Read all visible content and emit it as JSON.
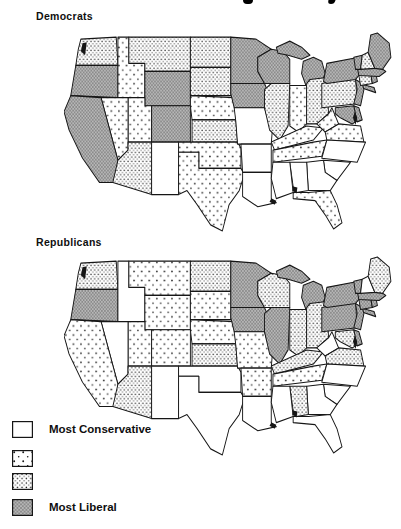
{
  "figure": {
    "maps": [
      {
        "id": "democrats",
        "label": "Democrats",
        "states": {
          "WA": 3,
          "OR": 4,
          "CA": 4,
          "ID": 2,
          "NV": 2,
          "UT": 2,
          "AZ": 3,
          "MT": 3,
          "WY": 4,
          "CO": 4,
          "NM": 1,
          "ND": 3,
          "SD": 3,
          "NE": 2,
          "KS": 3,
          "OK": 2,
          "TX": 2,
          "MN": 4,
          "IA": 4,
          "MO": 1,
          "AR": 1,
          "LA": 1,
          "WI": 4,
          "IL": 3,
          "MI": 4,
          "IN": 2,
          "OH": 3,
          "KY": 2,
          "TN": 2,
          "MS": 1,
          "AL": 1,
          "GA": 1,
          "FL": 2,
          "SC": 1,
          "NC": 1,
          "VA": 2,
          "WV": 2,
          "PA": 3,
          "NY": 4,
          "NJ": 4,
          "CT": 3,
          "RI": 4,
          "MA": 4,
          "VT": 4,
          "NH": 3,
          "ME": 4,
          "MD": 4,
          "DE": 4
        }
      },
      {
        "id": "republicans",
        "label": "Republicans",
        "states": {
          "WA": 3,
          "OR": 4,
          "CA": 2,
          "ID": 1,
          "NV": 1,
          "UT": 2,
          "AZ": 3,
          "MT": 2,
          "WY": 2,
          "CO": 2,
          "NM": 1,
          "ND": 3,
          "SD": 2,
          "NE": 2,
          "KS": 3,
          "OK": 1,
          "TX": 1,
          "MN": 4,
          "IA": 4,
          "MO": 2,
          "AR": 2,
          "LA": 1,
          "WI": 3,
          "IL": 4,
          "MI": 4,
          "IN": 3,
          "OH": 3,
          "KY": 3,
          "TN": 2,
          "MS": 1,
          "AL": 3,
          "GA": 1,
          "FL": 1,
          "SC": 1,
          "NC": 1,
          "VA": 3,
          "WV": 1,
          "PA": 4,
          "NY": 4,
          "NJ": 4,
          "CT": 4,
          "RI": 4,
          "MA": 4,
          "VT": 4,
          "NH": 1,
          "ME": 3,
          "MD": 3,
          "DE": 4
        }
      }
    ],
    "legend": {
      "items": [
        {
          "category": 1,
          "label": "Most Conservative",
          "pattern": "white"
        },
        {
          "category": 2,
          "label": "",
          "pattern": "sparse-dots"
        },
        {
          "category": 3,
          "label": "",
          "pattern": "dense-dots"
        },
        {
          "category": 4,
          "label": "Most Liberal",
          "pattern": "gray-shade"
        }
      ]
    },
    "colors": {
      "ink": "#161616",
      "liberal_gray": "#b7b7b7",
      "paper": "#ffffff"
    }
  }
}
